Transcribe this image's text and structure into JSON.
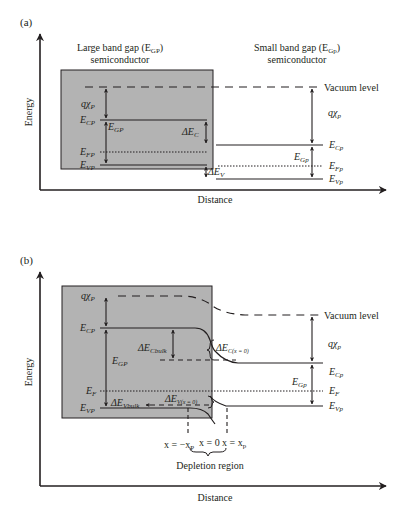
{
  "colors": {
    "box_fill": "#b3b3b3",
    "line": "#231f20",
    "background": "#ffffff"
  },
  "panel_a": {
    "label": "(a)",
    "y_axis_label": "Energy",
    "x_axis_label": "Distance",
    "left_title_line1": "Large band gap (E",
    "left_title_sub": "GP",
    "left_title_end": ")",
    "left_title_line2": "semiconductor",
    "right_title_line1": "Small band gap (E",
    "right_title_sub": "Gp",
    "right_title_end": ")",
    "right_title_line2": "semiconductor",
    "vacuum_level": "Vacuum level",
    "labels": {
      "chi_P": {
        "main": "qχ",
        "sub": "P"
      },
      "E_CP": {
        "main": "E",
        "sub": "CP"
      },
      "E_GP": {
        "main": "E",
        "sub": "GP"
      },
      "E_FP": {
        "main": "E",
        "sub": "FP"
      },
      "E_VP": {
        "main": "E",
        "sub": "VP"
      },
      "dE_C": {
        "main": "ΔE",
        "sub": "C"
      },
      "dE_V": {
        "main": "ΔE",
        "sub": "V"
      },
      "chi_p": {
        "main": "qχ",
        "sub": "p"
      },
      "E_Cp": {
        "main": "E",
        "sub": "Cp"
      },
      "E_Gp": {
        "main": "E",
        "sub": "Gp"
      },
      "E_Fp": {
        "main": "E",
        "sub": "Fp"
      },
      "E_Vp": {
        "main": "E",
        "sub": "Vp"
      }
    }
  },
  "panel_b": {
    "label": "(b)",
    "y_axis_label": "Energy",
    "x_axis_label": "Distance",
    "vacuum_level": "Vacuum level",
    "depletion_region": "Depletion region",
    "x_neg": "x = −x",
    "x_neg_sub": "P",
    "x_zero": "x = 0",
    "x_pos": "x = x",
    "x_pos_sub": "p",
    "labels": {
      "chi_P": {
        "main": "qχ",
        "sub": "P"
      },
      "E_CP": {
        "main": "E",
        "sub": "CP"
      },
      "E_GP": {
        "main": "E",
        "sub": "GP"
      },
      "E_F": {
        "main": "E",
        "sub": "F"
      },
      "E_VP": {
        "main": "E",
        "sub": "VP"
      },
      "dE_Cbulk": {
        "main": "ΔE",
        "sub": "Cbulk"
      },
      "dE_Vbulk": {
        "main": "ΔE",
        "sub": "Vbulk"
      },
      "dE_Cx0": {
        "main": "ΔE",
        "sub": "C(x = 0)"
      },
      "dE_Vx0": {
        "main": "ΔE",
        "sub": "V(x = 0)"
      },
      "chi_p": {
        "main": "qχ",
        "sub": "p"
      },
      "E_Cp": {
        "main": "E",
        "sub": "Cp"
      },
      "E_Gp": {
        "main": "E",
        "sub": "Gp"
      },
      "E_F2": {
        "main": "E",
        "sub": "F"
      },
      "E_Vp": {
        "main": "E",
        "sub": "Vp"
      }
    }
  }
}
